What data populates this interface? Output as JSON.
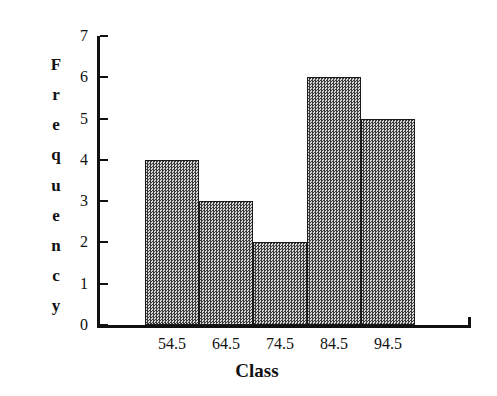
{
  "chart_data": {
    "type": "bar",
    "title": "",
    "subtitle": "",
    "xlabel": "Class",
    "ylabel": "Frequency",
    "categories": [
      "54.5",
      "64.5",
      "74.5",
      "84.5",
      "94.5"
    ],
    "values": [
      4,
      3,
      2,
      6,
      5
    ],
    "ylim": [
      0,
      7
    ],
    "yticks": [
      0,
      1,
      2,
      3,
      4,
      5,
      6,
      7
    ],
    "ytick_labels": [
      "0",
      "1",
      "2",
      "3",
      "4",
      "5",
      "6",
      "7"
    ],
    "grid": false,
    "legend": false,
    "legend_position": "none",
    "bar_gap": 0,
    "bar_fill_color": "#8b8b8b",
    "bar_edge_color": "#1a1a1a",
    "axis_color": "#111111",
    "background_color": "#ffffff"
  },
  "axes": {
    "y_title_letters": [
      "F",
      "r",
      "e",
      "q",
      "u",
      "e",
      "n",
      "c",
      "y"
    ],
    "x_title": "Class"
  }
}
